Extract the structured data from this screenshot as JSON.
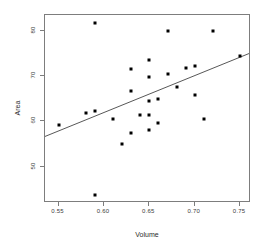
{
  "chart_data": {
    "type": "scatter",
    "title": "",
    "xlabel": "Volume",
    "ylabel": "Area",
    "xlim": [
      0.535,
      0.762
    ],
    "ylim": [
      42.0,
      83.5
    ],
    "grid": false,
    "legend": null,
    "xticks": [
      0.55,
      0.6,
      0.65,
      0.7,
      0.75
    ],
    "xticklabels": [
      "0.55",
      "0.60",
      "0.65",
      "0.70",
      "0.75"
    ],
    "yticks": [
      50,
      60,
      70,
      80
    ],
    "yticklabels": [
      "50",
      "60",
      "70",
      "80"
    ],
    "marker": "filled-square",
    "marker_color": "#000000",
    "points": [
      {
        "x": 0.55,
        "y": 59.3
      },
      {
        "x": 0.58,
        "y": 61.8
      },
      {
        "x": 0.59,
        "y": 62.4
      },
      {
        "x": 0.59,
        "y": 81.7
      },
      {
        "x": 0.59,
        "y": 43.8
      },
      {
        "x": 0.61,
        "y": 60.6
      },
      {
        "x": 0.62,
        "y": 55.1
      },
      {
        "x": 0.63,
        "y": 57.4
      },
      {
        "x": 0.63,
        "y": 66.8
      },
      {
        "x": 0.63,
        "y": 71.5
      },
      {
        "x": 0.64,
        "y": 61.5
      },
      {
        "x": 0.65,
        "y": 58.1
      },
      {
        "x": 0.65,
        "y": 61.5
      },
      {
        "x": 0.65,
        "y": 64.6
      },
      {
        "x": 0.65,
        "y": 69.9
      },
      {
        "x": 0.65,
        "y": 73.6
      },
      {
        "x": 0.66,
        "y": 59.7
      },
      {
        "x": 0.66,
        "y": 64.9
      },
      {
        "x": 0.67,
        "y": 70.4
      },
      {
        "x": 0.67,
        "y": 79.9
      },
      {
        "x": 0.68,
        "y": 67.5
      },
      {
        "x": 0.69,
        "y": 71.8
      },
      {
        "x": 0.7,
        "y": 72.2
      },
      {
        "x": 0.7,
        "y": 65.9
      },
      {
        "x": 0.71,
        "y": 60.6
      },
      {
        "x": 0.72,
        "y": 79.9
      },
      {
        "x": 0.75,
        "y": 74.5
      }
    ],
    "fit_line": {
      "type": "linear-regression",
      "color": "#555555",
      "x_start": 0.535,
      "y_start": 56.4,
      "x_end": 0.762,
      "y_end": 74.9
    }
  }
}
